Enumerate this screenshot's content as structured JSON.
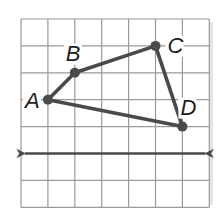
{
  "figure": {
    "type": "coordinate-grid-quadrilateral",
    "grid": {
      "columns": 7,
      "rows": 7,
      "origin_px": [
        21,
        19
      ],
      "cell_px": 26.9,
      "line_color": "#9a9a9a",
      "border_color": "#8a8a8a"
    },
    "stroke_color": "#4a4a4a",
    "points": [
      {
        "label": "A",
        "grid": [
          1,
          3
        ],
        "label_offset": [
          -23,
          8
        ]
      },
      {
        "label": "B",
        "grid": [
          2,
          2
        ],
        "label_offset": [
          -9,
          -12
        ]
      },
      {
        "label": "C",
        "grid": [
          5,
          1
        ],
        "label_offset": [
          12,
          7
        ]
      },
      {
        "label": "D",
        "grid": [
          6,
          4
        ],
        "label_offset": [
          -2,
          -12
        ]
      }
    ],
    "polygon_order": [
      "A",
      "B",
      "C",
      "D"
    ],
    "line": {
      "grid_y": 5,
      "arrows": "both"
    }
  }
}
